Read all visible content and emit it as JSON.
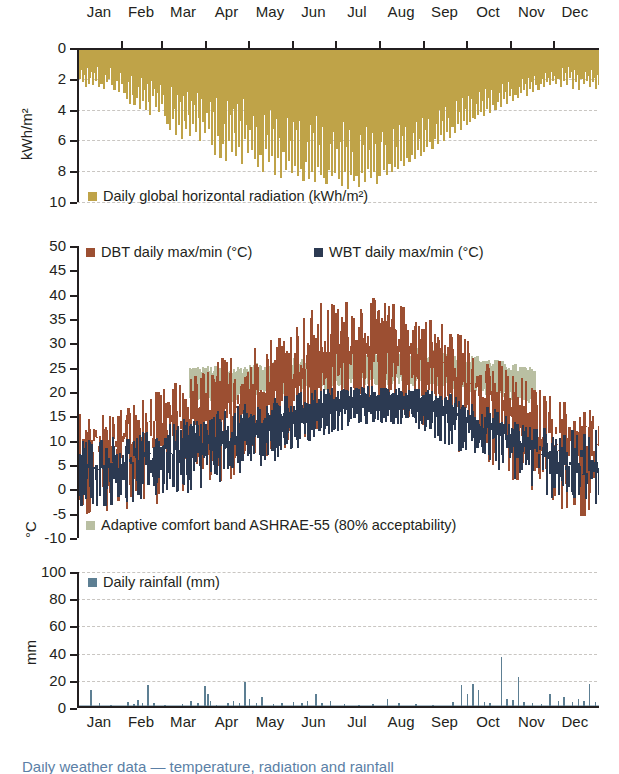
{
  "figure": {
    "months": [
      "Jan",
      "Feb",
      "Mar",
      "Apr",
      "May",
      "Jun",
      "Jul",
      "Aug",
      "Sep",
      "Oct",
      "Nov",
      "Dec"
    ],
    "caption_partial": "Daily weather data — temperature, radiation and rainfall"
  },
  "colors": {
    "radiation": "#bfa348",
    "dbt": "#9c4f32",
    "wbt": "#2c3a52",
    "comfort_band": "#b9bfa2",
    "rainfall": "#5d7f93",
    "axis": "#231f20",
    "grid": "#c9c6c2",
    "caption": "#5b7fa6"
  },
  "chart_data": [
    {
      "type": "bar",
      "id": "radiation",
      "title": "",
      "legend": [
        {
          "label": "Daily global horizontal radiation (kWh/m²)",
          "color": "#bfa348"
        }
      ],
      "legend_position": "bottom-left-inside",
      "ylabel": "kWh/m²",
      "xlabel": "",
      "ylim": [
        0,
        10
      ],
      "y_inverted": true,
      "yticks": [
        0,
        2,
        4,
        6,
        8,
        10
      ],
      "grid": true,
      "categories": [
        "Jan",
        "Feb",
        "Mar",
        "Apr",
        "May",
        "Jun",
        "Jul",
        "Aug",
        "Sep",
        "Oct",
        "Nov",
        "Dec"
      ],
      "values": [
        1.9,
        1.3,
        2.1,
        1.6,
        2.4,
        1.2,
        2.2,
        1.8,
        1.4,
        2.3,
        1.5,
        2.0,
        1.1,
        2.4,
        1.7,
        2.2,
        1.3,
        2.5,
        1.6,
        2.1,
        1.9,
        1.2,
        2.3,
        1.8,
        2.6,
        1.4,
        2.0,
        2.7,
        1.5,
        2.2,
        1.8,
        2.8,
        1.9,
        3.2,
        2.1,
        3.5,
        1.7,
        2.9,
        3.6,
        2.0,
        3.1,
        2.4,
        3.8,
        1.8,
        3.3,
        2.6,
        3.9,
        2.2,
        3.4,
        4.2,
        2.0,
        3.0,
        2.5,
        3.7,
        2.8,
        4.0,
        2.3,
        3.5,
        2.9,
        4.3,
        2.6,
        4.8,
        3.1,
        5.2,
        2.4,
        4.5,
        3.8,
        5.5,
        2.9,
        4.9,
        3.4,
        5.8,
        3.0,
        4.6,
        5.1,
        2.7,
        4.2,
        5.6,
        3.3,
        4.8,
        3.6,
        5.3,
        2.8,
        4.4,
        5.9,
        3.2,
        4.7,
        5.4,
        3.9,
        4.1,
        5.1,
        3.4,
        6.2,
        4.0,
        6.8,
        3.1,
        5.6,
        4.5,
        7.0,
        3.6,
        6.1,
        4.8,
        7.2,
        3.3,
        5.9,
        4.2,
        6.6,
        3.8,
        5.4,
        6.9,
        3.5,
        6.3,
        4.6,
        7.4,
        3.2,
        5.8,
        4.9,
        6.7,
        4.1,
        5.2,
        6.5,
        4.3,
        7.1,
        5.0,
        7.6,
        3.7,
        6.8,
        4.8,
        7.9,
        4.2,
        6.4,
        5.5,
        7.3,
        3.9,
        6.9,
        5.1,
        8.1,
        4.5,
        7.0,
        5.7,
        8.3,
        4.0,
        6.6,
        5.3,
        7.8,
        4.4,
        7.2,
        5.9,
        8.0,
        4.7,
        7.5,
        5.2,
        8.2,
        4.6,
        7.7,
        5.8,
        8.5,
        4.1,
        7.3,
        6.0,
        8.4,
        4.9,
        7.9,
        5.4,
        8.6,
        4.3,
        7.6,
        6.2,
        8.1,
        5.0,
        8.3,
        5.6,
        8.7,
        4.5,
        7.8,
        6.1,
        8.2,
        5.3,
        8.0,
        6.4,
        5.1,
        8.4,
        6.0,
        8.8,
        4.7,
        7.9,
        6.3,
        9.0,
        5.2,
        8.1,
        6.6,
        8.5,
        4.9,
        8.2,
        5.8,
        8.9,
        5.5,
        8.0,
        6.2,
        8.6,
        5.0,
        7.7,
        6.5,
        8.3,
        5.4,
        7.9,
        6.1,
        8.7,
        5.7,
        8.2,
        6.0,
        5.3,
        7.8,
        6.2,
        8.1,
        4.8,
        7.4,
        5.9,
        7.9,
        5.1,
        7.6,
        6.3,
        7.7,
        4.9,
        7.2,
        5.6,
        7.5,
        5.0,
        7.0,
        6.0,
        7.3,
        4.6,
        6.8,
        5.4,
        7.1,
        4.7,
        6.5,
        5.8,
        6.9,
        4.4,
        6.6,
        5.2,
        6.3,
        4.5,
        6.0,
        5.1,
        6.4,
        4.0,
        5.8,
        4.8,
        6.1,
        3.9,
        5.5,
        4.6,
        5.9,
        3.7,
        5.3,
        4.4,
        5.7,
        3.5,
        5.0,
        4.2,
        5.4,
        3.3,
        4.8,
        4.0,
        5.2,
        3.1,
        4.6,
        3.8,
        4.9,
        3.0,
        4.7,
        3.2,
        4.4,
        2.9,
        4.5,
        3.5,
        4.2,
        2.7,
        4.0,
        3.3,
        4.3,
        2.5,
        3.8,
        3.1,
        4.1,
        2.6,
        3.6,
        2.9,
        3.9,
        2.4,
        3.4,
        2.8,
        3.7,
        2.2,
        3.2,
        2.7,
        3.5,
        2.1,
        3.0,
        2.5,
        3.3,
        2.3,
        2.9,
        2.0,
        3.1,
        2.4,
        2.8,
        1.9,
        2.6,
        2.2,
        3.0,
        1.8,
        2.5,
        2.1,
        2.7,
        1.7,
        2.3,
        2.0,
        2.6,
        1.6,
        2.2,
        1.9,
        2.4,
        1.5,
        2.1,
        1.8,
        2.3,
        1.4,
        2.0,
        1.7,
        2.2,
        1.3,
        1.9,
        1.6,
        2.4,
        1.2,
        2.0,
        1.5,
        2.3,
        1.1,
        1.8,
        1.4,
        2.5,
        1.3,
        2.1,
        1.6,
        2.6,
        1.2,
        1.9,
        1.5,
        2.2,
        1.4,
        2.0,
        1.7,
        2.4,
        1.3,
        2.1,
        1.8,
        2.5,
        1.6,
        2.3
      ],
      "notes": "Daily values, inverted axis hanging from the top; minimum solar in Jan/Dec, maximum in Jun/Jul."
    },
    {
      "type": "line",
      "id": "temperature",
      "title": "",
      "legend": [
        {
          "label": "DBT daily max/min (°C)",
          "color": "#9c4f32"
        },
        {
          "label": "WBT daily max/min (°C)",
          "color": "#2c3a52"
        },
        {
          "label": "Adaptive comfort band ASHRAE-55 (80% acceptability)",
          "color": "#b9bfa2"
        }
      ],
      "legend_position": "inside-top and inside-bottom",
      "ylabel": "°C",
      "xlabel": "",
      "ylim": [
        -10,
        50
      ],
      "yticks": [
        50,
        45,
        40,
        35,
        30,
        25,
        20,
        15,
        10,
        5,
        0,
        -5,
        -10
      ],
      "grid": true,
      "categories": [
        "Jan",
        "Feb",
        "Mar",
        "Apr",
        "May",
        "Jun",
        "Jul",
        "Aug",
        "Sep",
        "Oct",
        "Nov",
        "Dec"
      ],
      "series": [
        {
          "name": "DBT daily max (°C)",
          "monthly_typical": [
            11,
            13,
            17,
            21,
            26,
            31,
            34,
            33,
            28,
            22,
            15,
            11
          ],
          "monthly_peak": [
            15,
            18,
            22,
            27,
            31,
            37,
            38.7,
            37,
            33,
            27,
            20,
            16
          ]
        },
        {
          "name": "DBT daily min (°C)",
          "monthly_typical": [
            3,
            4,
            7,
            10,
            14,
            19,
            22,
            21,
            17,
            12,
            7,
            3
          ],
          "monthly_low": [
            -5,
            -4,
            -1,
            2,
            7,
            12,
            16,
            15,
            9,
            4,
            -2,
            -5.5
          ]
        },
        {
          "name": "WBT daily max (°C)",
          "monthly_typical": [
            7,
            8,
            11,
            13,
            16,
            19,
            20,
            20,
            18,
            14,
            10,
            7
          ],
          "monthly_peak": [
            11,
            12,
            15,
            17,
            19,
            21,
            21.5,
            21,
            20,
            17,
            13,
            12.5
          ]
        },
        {
          "name": "WBT daily min (°C)",
          "monthly_typical": [
            1,
            2,
            4,
            6,
            9,
            13,
            15,
            15,
            12,
            8,
            4,
            1
          ],
          "monthly_low": [
            -5,
            -4,
            -2,
            1,
            5,
            10,
            13,
            13,
            8,
            3,
            -2,
            -5.5
          ]
        },
        {
          "name": "Adaptive comfort band upper (°C)",
          "monthly_typical": [
            null,
            null,
            24.5,
            24.3,
            25.5,
            27.0,
            28.0,
            28.2,
            27.5,
            26.0,
            24.0,
            null
          ]
        },
        {
          "name": "Adaptive comfort band lower (°C)",
          "monthly_typical": [
            null,
            null,
            19.0,
            18.5,
            20.0,
            21.0,
            22.0,
            22.2,
            21.5,
            20.0,
            18.2,
            null
          ]
        }
      ],
      "notes": "Daily max/min envelopes for dry-bulb and wet-bulb temperature; sage comfort band present mid-March to early November."
    },
    {
      "type": "bar",
      "id": "rainfall",
      "title": "",
      "legend": [
        {
          "label": "Daily rainfall (mm)",
          "color": "#5d7f93"
        }
      ],
      "legend_position": "top-left-inside",
      "ylabel": "mm",
      "xlabel": "",
      "ylim": [
        0,
        100
      ],
      "yticks": [
        100,
        80,
        60,
        40,
        20,
        0
      ],
      "grid": true,
      "categories": [
        "Jan",
        "Feb",
        "Mar",
        "Apr",
        "May",
        "Jun",
        "Jul",
        "Aug",
        "Sep",
        "Oct",
        "Nov",
        "Dec"
      ],
      "events": [
        {
          "day": 8,
          "mm": 11.5
        },
        {
          "day": 14,
          "mm": 2.0
        },
        {
          "day": 22,
          "mm": 1.0
        },
        {
          "day": 34,
          "mm": 3.0
        },
        {
          "day": 38,
          "mm": 1.5
        },
        {
          "day": 41,
          "mm": 4.5
        },
        {
          "day": 44,
          "mm": 2.0
        },
        {
          "day": 48,
          "mm": 15.5
        },
        {
          "day": 52,
          "mm": 2.5
        },
        {
          "day": 60,
          "mm": 1.0
        },
        {
          "day": 72,
          "mm": 1.5
        },
        {
          "day": 78,
          "mm": 4.0
        },
        {
          "day": 83,
          "mm": 2.0
        },
        {
          "day": 88,
          "mm": 15.0
        },
        {
          "day": 90,
          "mm": 9.0
        },
        {
          "day": 92,
          "mm": 4.0
        },
        {
          "day": 96,
          "mm": 1.0
        },
        {
          "day": 104,
          "mm": 2.5
        },
        {
          "day": 108,
          "mm": 3.5
        },
        {
          "day": 112,
          "mm": 2.0
        },
        {
          "day": 116,
          "mm": 17.5
        },
        {
          "day": 119,
          "mm": 5.0
        },
        {
          "day": 124,
          "mm": 2.0
        },
        {
          "day": 128,
          "mm": 6.5
        },
        {
          "day": 136,
          "mm": 1.5
        },
        {
          "day": 142,
          "mm": 2.0
        },
        {
          "day": 150,
          "mm": 3.0
        },
        {
          "day": 156,
          "mm": 2.5
        },
        {
          "day": 160,
          "mm": 3.5
        },
        {
          "day": 166,
          "mm": 9.0
        },
        {
          "day": 170,
          "mm": 2.0
        },
        {
          "day": 176,
          "mm": 4.0
        },
        {
          "day": 186,
          "mm": 1.5
        },
        {
          "day": 196,
          "mm": 1.0
        },
        {
          "day": 206,
          "mm": 1.5
        },
        {
          "day": 216,
          "mm": 5.0
        },
        {
          "day": 224,
          "mm": 2.0
        },
        {
          "day": 236,
          "mm": 1.5
        },
        {
          "day": 248,
          "mm": 1.0
        },
        {
          "day": 262,
          "mm": 3.0
        },
        {
          "day": 268,
          "mm": 15.5
        },
        {
          "day": 272,
          "mm": 9.0
        },
        {
          "day": 276,
          "mm": 16.0
        },
        {
          "day": 280,
          "mm": 12.0
        },
        {
          "day": 284,
          "mm": 3.0
        },
        {
          "day": 288,
          "mm": 2.0
        },
        {
          "day": 296,
          "mm": 36.0
        },
        {
          "day": 300,
          "mm": 5.0
        },
        {
          "day": 304,
          "mm": 4.5
        },
        {
          "day": 308,
          "mm": 21.0
        },
        {
          "day": 312,
          "mm": 3.0
        },
        {
          "day": 318,
          "mm": 2.0
        },
        {
          "day": 324,
          "mm": 1.5
        },
        {
          "day": 330,
          "mm": 9.0
        },
        {
          "day": 336,
          "mm": 4.0
        },
        {
          "day": 340,
          "mm": 6.5
        },
        {
          "day": 346,
          "mm": 3.0
        },
        {
          "day": 350,
          "mm": 5.5
        },
        {
          "day": 354,
          "mm": 4.0
        },
        {
          "day": 358,
          "mm": 16.5
        },
        {
          "day": 362,
          "mm": 3.0
        }
      ],
      "notes": "Sparse daily rainfall spikes; largest event about 36 mm in late October."
    }
  ]
}
